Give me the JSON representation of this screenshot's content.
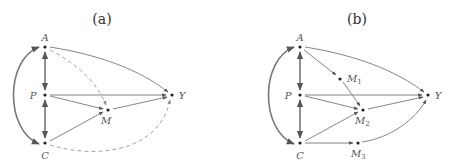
{
  "panels": [
    {
      "title": "(a)",
      "nodes": [
        {
          "id": "A",
          "label": "A"
        },
        {
          "id": "P",
          "label": "P"
        },
        {
          "id": "C",
          "label": "C"
        },
        {
          "id": "M",
          "label": "M"
        },
        {
          "id": "Y",
          "label": "Y"
        }
      ],
      "edges": [
        {
          "from": "A",
          "to": "P",
          "style": "double-arrow-thick"
        },
        {
          "from": "P",
          "to": "C",
          "style": "double-arrow-thick"
        },
        {
          "from": "C",
          "to": "A",
          "style": "curved-double-arrow-thick"
        },
        {
          "from": "A",
          "to": "Y",
          "style": "solid-curved"
        },
        {
          "from": "P",
          "to": "Y",
          "style": "solid"
        },
        {
          "from": "P",
          "to": "M",
          "style": "solid"
        },
        {
          "from": "C",
          "to": "M",
          "style": "solid"
        },
        {
          "from": "M",
          "to": "Y",
          "style": "solid"
        },
        {
          "from": "A",
          "to": "M",
          "style": "dashed-curved"
        },
        {
          "from": "C",
          "to": "Y",
          "style": "dashed-curved"
        }
      ]
    },
    {
      "title": "(b)",
      "nodes": [
        {
          "id": "A",
          "label": "A"
        },
        {
          "id": "P",
          "label": "P"
        },
        {
          "id": "C",
          "label": "C"
        },
        {
          "id": "M1",
          "label": "M",
          "sub": "1"
        },
        {
          "id": "M2",
          "label": "M",
          "sub": "2"
        },
        {
          "id": "M3",
          "label": "M",
          "sub": "3"
        },
        {
          "id": "Y",
          "label": "Y"
        }
      ],
      "edges": [
        {
          "from": "A",
          "to": "P",
          "style": "double-arrow-thick"
        },
        {
          "from": "P",
          "to": "C",
          "style": "double-arrow-thick"
        },
        {
          "from": "C",
          "to": "A",
          "style": "curved-double-arrow-thick"
        },
        {
          "from": "A",
          "to": "Y",
          "style": "solid-curved"
        },
        {
          "from": "A",
          "to": "M1",
          "style": "solid"
        },
        {
          "from": "M1",
          "to": "M2",
          "style": "solid"
        },
        {
          "from": "P",
          "to": "Y",
          "style": "solid"
        },
        {
          "from": "P",
          "to": "M2",
          "style": "solid"
        },
        {
          "from": "C",
          "to": "M2",
          "style": "solid"
        },
        {
          "from": "M2",
          "to": "Y",
          "style": "solid"
        },
        {
          "from": "C",
          "to": "M3",
          "style": "solid"
        },
        {
          "from": "M3",
          "to": "Y",
          "style": "solid-curved"
        }
      ]
    }
  ]
}
